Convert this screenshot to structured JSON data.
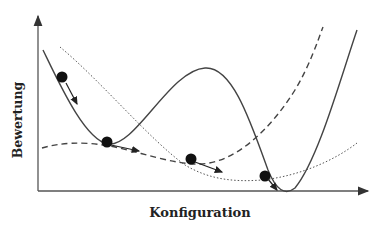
{
  "diagram": {
    "title": "",
    "axes": {
      "xlabel": "Konfiguration",
      "ylabel": "Bewertung"
    },
    "curves": [
      {
        "name": "solid-landscape",
        "style": "solid",
        "description": "rugged landscape with two local minima and a central peak"
      },
      {
        "name": "dashed-landscape",
        "style": "dashed",
        "description": "smooth landscape with a single shallow minimum in the middle"
      },
      {
        "name": "dotted-landscape",
        "style": "dotted",
        "description": "smooth landscape with a minimum to the right"
      }
    ],
    "balls": [
      {
        "label": "ball-1",
        "on": "solid-landscape",
        "position": "upper-left slope",
        "arrow": "downhill"
      },
      {
        "label": "ball-2",
        "on": "solid/dashed",
        "position": "first local minimum",
        "arrow": "right"
      },
      {
        "label": "ball-3",
        "on": "dashed-landscape",
        "position": "middle minimum",
        "arrow": "right"
      },
      {
        "label": "ball-4",
        "on": "dotted/solid",
        "position": "near global minimum",
        "arrow": "downhill"
      }
    ],
    "colors": {
      "line": "#333333",
      "ball": "#111111",
      "background": "#ffffff"
    }
  }
}
